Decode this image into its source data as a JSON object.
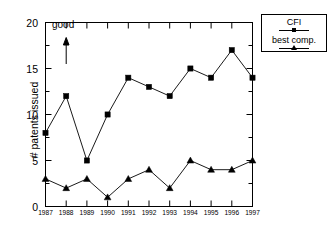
{
  "chart_data": {
    "type": "line",
    "title": "",
    "xlabel": "",
    "ylabel": "# patents issued",
    "categories": [
      "1987",
      "1988",
      "1989",
      "1990",
      "1991",
      "1992",
      "1993",
      "1994",
      "1995",
      "1996",
      "1997"
    ],
    "x": [
      1987,
      1988,
      1989,
      1990,
      1991,
      1992,
      1993,
      1994,
      1995,
      1996,
      1997
    ],
    "series": [
      {
        "name": "CFI",
        "marker": "square",
        "color": "#000000",
        "values": [
          8,
          12,
          5,
          10,
          14,
          13,
          12,
          15,
          14,
          17,
          14
        ]
      },
      {
        "name": "best comp.",
        "marker": "triangle",
        "color": "#000000",
        "values": [
          3,
          2,
          3,
          1,
          3,
          4,
          2,
          5,
          4,
          4,
          5
        ]
      }
    ],
    "ylim": [
      0,
      20
    ],
    "yticks": [
      0,
      5,
      10,
      15,
      20
    ],
    "yticklabels": [
      "0",
      "5",
      "10",
      "15",
      "20"
    ],
    "xlim": [
      1987,
      1997
    ],
    "grid": false,
    "legend_position": "outside-top-right",
    "annotations": [
      {
        "text": "good",
        "x": 1988,
        "y": 19,
        "arrow": "up",
        "arrow_from_y": 17.2,
        "arrow_to_y": 18.6
      }
    ]
  },
  "axes": {
    "y_tick_labels": [
      "20",
      "15",
      "10",
      "5",
      "0"
    ],
    "y_axis_title": "# patents issued",
    "x_tick_labels": [
      "1987",
      "1988",
      "1989",
      "1990",
      "1991",
      "1992",
      "1993",
      "1994",
      "1995",
      "1996",
      "1997"
    ]
  },
  "annotation": {
    "good_label": "good"
  },
  "legend": {
    "entries": [
      {
        "label": "CFI",
        "marker": "square-marker"
      },
      {
        "label": "best comp.",
        "marker": "triangle-marker"
      }
    ]
  }
}
